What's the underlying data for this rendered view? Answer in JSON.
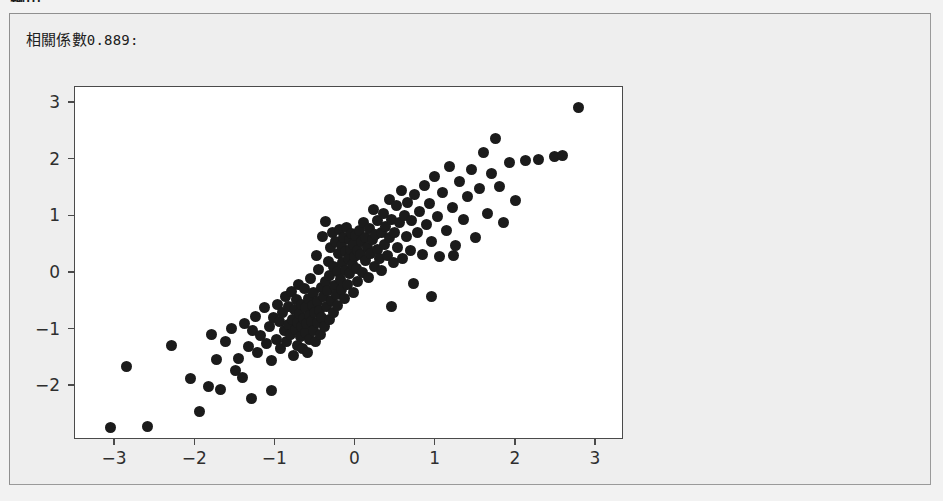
{
  "page": {
    "heading": "輸出",
    "background_color": "#f2f2f2"
  },
  "output_panel": {
    "name": "output-panel",
    "background_color": "#eeeeee",
    "border_color": "#8f8f8f",
    "correlation_label_prefix": "相關係數",
    "correlation_value": "0.889",
    "correlation_suffix": ":",
    "correlation_full_text": "相關係數0.889:"
  },
  "chart_data": {
    "type": "scatter",
    "title": "",
    "xlabel": "",
    "ylabel": "",
    "xlim": [
      -3.5,
      3.35
    ],
    "ylim": [
      -2.95,
      3.28
    ],
    "xticks": [
      -3,
      -2,
      -1,
      0,
      1,
      2,
      3
    ],
    "yticks": [
      -2,
      -1,
      0,
      1,
      2,
      3
    ],
    "xticklabels": [
      "−3",
      "−2",
      "−1",
      "0",
      "1",
      "2",
      "3"
    ],
    "yticklabels": [
      "−2",
      "−1",
      "0",
      "1",
      "2",
      "3"
    ],
    "grid": false,
    "legend": null,
    "marker": {
      "color": "#1b1b1b",
      "shape": "circle",
      "size_px": 11
    },
    "correlation": 0.889,
    "n_points": 200,
    "points": [
      [
        -3.06,
        -2.73
      ],
      [
        -2.86,
        -1.66
      ],
      [
        -2.59,
        -2.71
      ],
      [
        -2.29,
        -1.28
      ],
      [
        -2.06,
        -1.86
      ],
      [
        -1.95,
        -2.45
      ],
      [
        -1.84,
        -2.0
      ],
      [
        -1.8,
        -1.09
      ],
      [
        -1.74,
        -1.53
      ],
      [
        -1.68,
        -2.05
      ],
      [
        -1.62,
        -1.22
      ],
      [
        -1.55,
        -0.98
      ],
      [
        -1.5,
        -1.72
      ],
      [
        -1.46,
        -1.52
      ],
      [
        -1.41,
        -1.84
      ],
      [
        -1.38,
        -0.9
      ],
      [
        -1.33,
        -1.3
      ],
      [
        -1.29,
        -1.02
      ],
      [
        -1.25,
        -0.77
      ],
      [
        -1.22,
        -1.41
      ],
      [
        -1.18,
        -1.1
      ],
      [
        -1.14,
        -0.62
      ],
      [
        -1.11,
        -1.25
      ],
      [
        -1.07,
        -0.95
      ],
      [
        -1.05,
        -1.55
      ],
      [
        -1.02,
        -0.78
      ],
      [
        -0.99,
        -1.18
      ],
      [
        -0.97,
        -0.56
      ],
      [
        -0.95,
        -0.86
      ],
      [
        -0.93,
        -1.34
      ],
      [
        -0.91,
        -0.7
      ],
      [
        -0.89,
        -1.02
      ],
      [
        -0.87,
        -0.42
      ],
      [
        -0.86,
        -1.21
      ],
      [
        -0.84,
        -0.91
      ],
      [
        -0.83,
        -0.6
      ],
      [
        -0.81,
        -1.08
      ],
      [
        -0.8,
        -0.33
      ],
      [
        -0.79,
        -0.82
      ],
      [
        -0.78,
        -1.45
      ],
      [
        -0.76,
        -0.65
      ],
      [
        -0.75,
        -1.0
      ],
      [
        -0.74,
        -0.47
      ],
      [
        -0.73,
        -0.88
      ],
      [
        -0.72,
        -1.28
      ],
      [
        -0.71,
        -0.2
      ],
      [
        -0.7,
        -0.72
      ],
      [
        -0.69,
        -1.12
      ],
      [
        -0.68,
        -0.95
      ],
      [
        -0.67,
        -0.55
      ],
      [
        -0.66,
        -1.33
      ],
      [
        -0.65,
        -0.8
      ],
      [
        -0.64,
        -0.28
      ],
      [
        -0.63,
        -1.05
      ],
      [
        -0.62,
        -0.62
      ],
      [
        -0.61,
        -0.9
      ],
      [
        -0.6,
        -1.4
      ],
      [
        -0.59,
        -0.45
      ],
      [
        -0.58,
        -0.75
      ],
      [
        -0.57,
        -1.18
      ],
      [
        -0.56,
        -0.1
      ],
      [
        -0.55,
        -0.85
      ],
      [
        -0.54,
        -0.58
      ],
      [
        -0.53,
        -1.02
      ],
      [
        -0.52,
        -0.35
      ],
      [
        -0.51,
        -0.7
      ],
      [
        -0.5,
        -1.22
      ],
      [
        -0.49,
        0.3
      ],
      [
        -0.48,
        -0.5
      ],
      [
        -0.47,
        -0.88
      ],
      [
        -0.46,
        0.06
      ],
      [
        -0.45,
        -0.66
      ],
      [
        -0.44,
        -1.09
      ],
      [
        -0.43,
        -0.25
      ],
      [
        -0.42,
        -0.78
      ],
      [
        -0.41,
        0.65
      ],
      [
        -0.4,
        -0.42
      ],
      [
        -0.39,
        -0.95
      ],
      [
        -0.38,
        -0.15
      ],
      [
        -0.37,
        0.9
      ],
      [
        -0.36,
        -0.6
      ],
      [
        -0.35,
        -0.32
      ],
      [
        -0.34,
        0.2
      ],
      [
        -0.33,
        -0.82
      ],
      [
        -0.32,
        -0.05
      ],
      [
        -0.31,
        0.45
      ],
      [
        -0.3,
        -0.48
      ],
      [
        -0.29,
        0.72
      ],
      [
        -0.28,
        -0.7
      ],
      [
        -0.27,
        0.12
      ],
      [
        -0.26,
        -0.22
      ],
      [
        -0.25,
        0.55
      ],
      [
        -0.24,
        -0.38
      ],
      [
        -0.23,
        0.02
      ],
      [
        -0.22,
        -0.58
      ],
      [
        -0.21,
        0.34
      ],
      [
        -0.2,
        0.77
      ],
      [
        -0.19,
        -0.12
      ],
      [
        -0.18,
        0.48
      ],
      [
        -0.17,
        -0.3
      ],
      [
        -0.16,
        0.18
      ],
      [
        -0.15,
        0.62
      ],
      [
        -0.14,
        -0.45
      ],
      [
        -0.13,
        0.05
      ],
      [
        -0.12,
        0.38
      ],
      [
        -0.11,
        0.8
      ],
      [
        -0.1,
        -0.2
      ],
      [
        -0.09,
        0.25
      ],
      [
        -0.08,
        0.58
      ],
      [
        -0.07,
        -0.02
      ],
      [
        -0.06,
        0.42
      ],
      [
        -0.05,
        0.7
      ],
      [
        -0.04,
        0.14
      ],
      [
        -0.03,
        -0.35
      ],
      [
        -0.02,
        0.5
      ],
      [
        -0.01,
        0.28
      ],
      [
        0.0,
        0.66
      ],
      [
        0.01,
        0.08
      ],
      [
        0.02,
        0.4
      ],
      [
        0.03,
        -0.15
      ],
      [
        0.05,
        0.75
      ],
      [
        0.06,
        0.32
      ],
      [
        0.08,
        0.55
      ],
      [
        0.09,
        0.0
      ],
      [
        0.1,
        0.88
      ],
      [
        0.12,
        0.22
      ],
      [
        0.13,
        0.62
      ],
      [
        0.15,
        0.44
      ],
      [
        0.16,
        -0.08
      ],
      [
        0.18,
        0.78
      ],
      [
        0.19,
        0.35
      ],
      [
        0.21,
        0.58
      ],
      [
        0.22,
        1.12
      ],
      [
        0.24,
        0.12
      ],
      [
        0.25,
        0.68
      ],
      [
        0.27,
        0.42
      ],
      [
        0.28,
        0.92
      ],
      [
        0.3,
        0.25
      ],
      [
        0.32,
        0.72
      ],
      [
        0.33,
        0.05
      ],
      [
        0.35,
        1.05
      ],
      [
        0.36,
        0.5
      ],
      [
        0.38,
        0.82
      ],
      [
        0.4,
        0.3
      ],
      [
        0.42,
        1.3
      ],
      [
        0.43,
        0.62
      ],
      [
        0.45,
        0.95
      ],
      [
        0.47,
        0.18
      ],
      [
        0.49,
        0.72
      ],
      [
        0.51,
        1.18
      ],
      [
        0.53,
        0.45
      ],
      [
        0.55,
        0.88
      ],
      [
        0.57,
        1.45
      ],
      [
        0.59,
        0.25
      ],
      [
        0.61,
        1.02
      ],
      [
        0.63,
        0.65
      ],
      [
        0.65,
        1.25
      ],
      [
        0.68,
        0.4
      ],
      [
        0.7,
        0.92
      ],
      [
        0.72,
        -0.18
      ],
      [
        0.74,
        1.38
      ],
      [
        0.77,
        0.72
      ],
      [
        0.8,
        1.08
      ],
      [
        0.83,
        0.32
      ],
      [
        0.86,
        1.55
      ],
      [
        0.89,
        0.85
      ],
      [
        0.92,
        1.22
      ],
      [
        0.95,
        0.55
      ],
      [
        0.98,
        1.7
      ],
      [
        1.02,
        1.0
      ],
      [
        1.05,
        0.28
      ],
      [
        1.09,
        1.42
      ],
      [
        1.13,
        0.75
      ],
      [
        1.17,
        1.88
      ],
      [
        1.21,
        1.15
      ],
      [
        1.25,
        0.48
      ],
      [
        1.3,
        1.62
      ],
      [
        1.35,
        0.95
      ],
      [
        1.4,
        1.35
      ],
      [
        1.45,
        1.82
      ],
      [
        1.5,
        0.62
      ],
      [
        1.55,
        1.48
      ],
      [
        1.6,
        2.12
      ],
      [
        1.65,
        1.05
      ],
      [
        1.7,
        1.75
      ],
      [
        1.75,
        2.38
      ],
      [
        1.8,
        1.52
      ],
      [
        1.85,
        0.88
      ],
      [
        1.92,
        1.95
      ],
      [
        2.0,
        1.28
      ],
      [
        2.12,
        1.98
      ],
      [
        2.28,
        2.0
      ],
      [
        2.48,
        2.05
      ],
      [
        2.58,
        2.07
      ],
      [
        2.78,
        2.92
      ],
      [
        -1.3,
        -2.22
      ],
      [
        -1.05,
        -2.08
      ],
      [
        0.45,
        -0.6
      ],
      [
        0.95,
        -0.42
      ],
      [
        1.22,
        0.3
      ]
    ]
  }
}
